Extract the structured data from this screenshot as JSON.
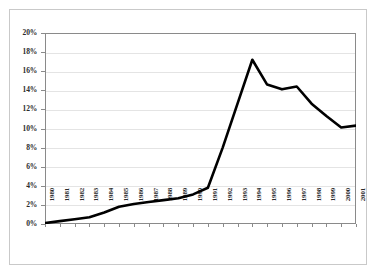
{
  "chart_data": {
    "type": "line",
    "title": "",
    "subtitle": "",
    "xlabel": "",
    "ylabel": "",
    "categories": [
      "1980",
      "1981",
      "1982",
      "1983",
      "1984",
      "1985",
      "1986",
      "1987",
      "1988",
      "1989",
      "1990",
      "1991",
      "1992",
      "1993",
      "1994",
      "1995",
      "1996",
      "1997",
      "1998",
      "1999",
      "2000",
      "2001"
    ],
    "values": [
      0.1,
      0.3,
      0.5,
      0.7,
      1.2,
      1.8,
      2.1,
      2.3,
      2.5,
      2.7,
      3.1,
      3.8,
      8.0,
      12.6,
      17.2,
      14.6,
      14.1,
      14.4,
      12.6,
      11.3,
      10.1,
      10.3
    ],
    "series": [
      {
        "name": "",
        "values": [
          0.1,
          0.3,
          0.5,
          0.7,
          1.2,
          1.8,
          2.1,
          2.3,
          2.5,
          2.7,
          3.1,
          3.8,
          8.0,
          12.6,
          17.2,
          14.6,
          14.1,
          14.4,
          12.6,
          11.3,
          10.1,
          10.3
        ]
      }
    ],
    "ylim": [
      0,
      20
    ],
    "ytick_values": [
      0,
      2,
      4,
      6,
      8,
      10,
      12,
      14,
      16,
      18,
      20
    ],
    "ytick_labels": [
      "0%",
      "2%",
      "4%",
      "6%",
      "8%",
      "10%",
      "12%",
      "14%",
      "16%",
      "18%",
      "20%"
    ],
    "grid": true,
    "grid_axis": "y",
    "legend": false,
    "legend_position": "none",
    "annotations": [],
    "colors": {
      "line": "#000000",
      "grid": "#e4e4e4",
      "axis": "#8a8a8a",
      "plot_background": "#ffffff",
      "frame_border": "#c9c9c9",
      "tick_label": "#2b2b2b"
    },
    "line_width": 2.6
  }
}
